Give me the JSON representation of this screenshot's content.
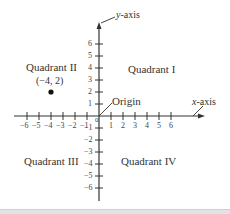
{
  "diagram": {
    "type": "cartesian-coordinate-plane",
    "quadrants": {
      "q1": "Quadrant I",
      "q2": "Quadrant II",
      "q3": "Quadrant III",
      "q4": "Quadrant IV"
    },
    "axes": {
      "x_label_var": "x",
      "x_label_rest": "-axis",
      "y_label_var": "y",
      "y_label_rest": "-axis",
      "origin_label": "Origin",
      "origin_tick": "0"
    },
    "x_ticks": [
      "−6",
      "−5",
      "−4",
      "−3",
      "−2",
      "−1",
      "1",
      "2",
      "3",
      "4",
      "5",
      "6"
    ],
    "y_ticks_pos": [
      "1",
      "2",
      "3",
      "4",
      "5",
      "6"
    ],
    "y_ticks_neg": [
      "−1",
      "−2",
      "−3",
      "−4",
      "−5",
      "−6"
    ],
    "point": {
      "label": "(−4, 2)",
      "x": -4,
      "y": 2
    },
    "colors": {
      "axis": "#333333",
      "text": "#333333",
      "point": "#111111"
    }
  }
}
